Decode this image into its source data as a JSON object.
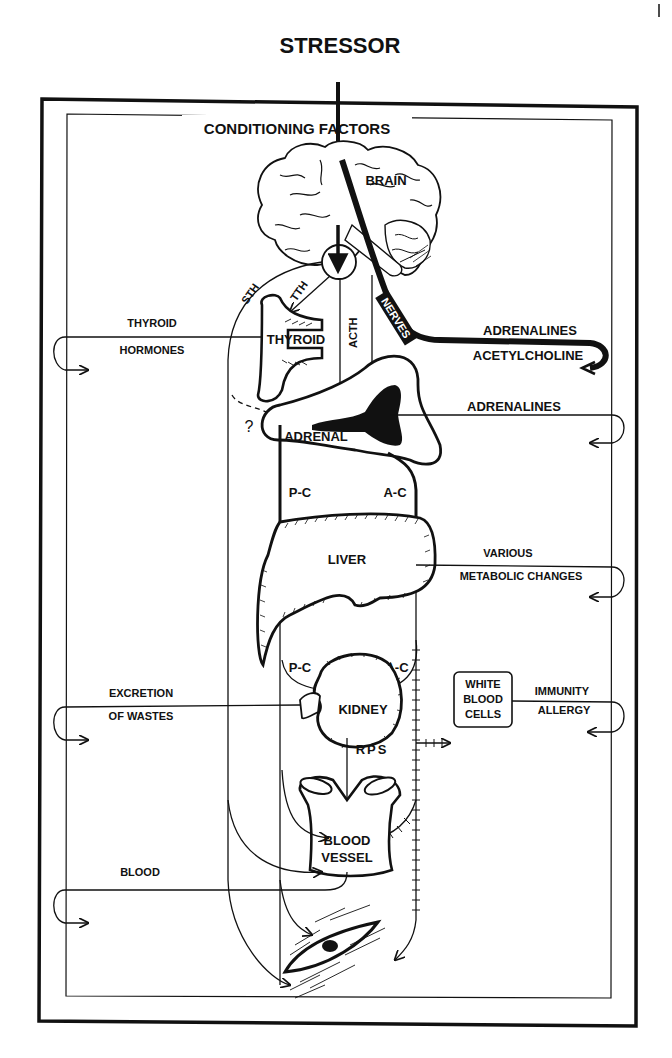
{
  "diagram": {
    "title": "STRESSOR",
    "frame_label": "CONDITIONING FACTORS",
    "colors": {
      "ink": "#111111",
      "paper": "#ffffff"
    },
    "organs": {
      "brain": "BRAIN",
      "thyroid": "THYROID",
      "adrenal": "ADRENAL",
      "liver": "LIVER",
      "kidney": "KIDNEY",
      "white_blood_cells": [
        "WHITE",
        "BLOOD",
        "CELLS"
      ],
      "blood_vessel": [
        "BLOOD",
        "VESSEL"
      ]
    },
    "pathway_labels": {
      "sth": "STH",
      "tth": "TTH",
      "acth": "ACTH",
      "nerves": "NERVES",
      "question": "?",
      "pc_upper": "P-C",
      "ac_upper": "A-C",
      "pc_lower": "P-C",
      "ac_lower": "A-C",
      "rps": "RPS"
    },
    "effects": {
      "thyroid_hormones": [
        "THYROID",
        "HORMONES"
      ],
      "adrenalines_acetylcholine": [
        "ADRENALINES",
        "ACETYLCHOLINE"
      ],
      "adrenalines": "ADRENALINES",
      "metabolic": [
        "VARIOUS",
        "METABOLIC CHANGES"
      ],
      "excretion": [
        "EXCRETION",
        "OF WASTES"
      ],
      "immunity": [
        "IMMUNITY",
        "ALLERGY"
      ],
      "blood": "BLOOD"
    },
    "page_mark": "|"
  }
}
